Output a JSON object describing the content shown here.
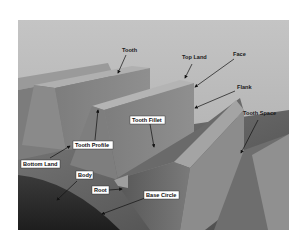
{
  "figure": {
    "labels": {
      "tooth": "Tooth",
      "top_land": "Top Land",
      "face": "Face",
      "flank": "Flank",
      "tooth_space": "Tooth Space",
      "tooth_fillet": "Tooth Fillet",
      "tooth_profile": "Tooth Profile",
      "bottom_land": "Bottom Land",
      "body": "Body",
      "root": "Root",
      "base_circle": "Base Circle"
    },
    "colors": {
      "background": "#ffffff",
      "sky": "#bdbdbd",
      "tooth_light": "#a8a8a8",
      "tooth_mid": "#8a8a8a",
      "tooth_dark": "#5a5a5a",
      "body_dark": "#262626",
      "label_box": "#ffffff",
      "arrow": "#1a1a1a"
    }
  }
}
